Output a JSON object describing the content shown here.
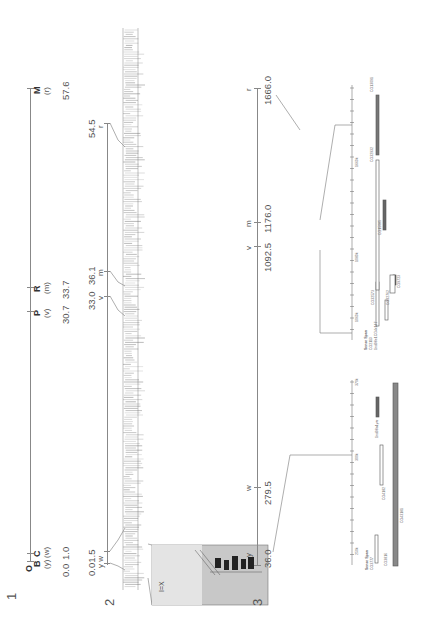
{
  "figure": {
    "panels": [
      {
        "id": "1",
        "label": "1",
        "type": "genetic-map-overview",
        "unit": "cM",
        "markers": [
          {
            "name": "B",
            "allele": "(y)",
            "position": "0.0"
          },
          {
            "name": "C",
            "allele": "(w)",
            "position": "1.0"
          },
          {
            "name": "P",
            "allele": "(v)",
            "position": "30.7"
          },
          {
            "name": "R",
            "allele": "(m)",
            "position": "33.7"
          },
          {
            "name": "M",
            "allele": "(r)",
            "position": "57.6"
          }
        ],
        "top_label_extra": "O"
      },
      {
        "id": "2",
        "label": "2",
        "type": "genetic-map-detailed",
        "markers": [
          {
            "allele": "y",
            "position": "0.0"
          },
          {
            "allele": "w",
            "position": "1.5"
          },
          {
            "allele": "v",
            "position": "33.0"
          },
          {
            "allele": "m",
            "position": "36.1"
          },
          {
            "allele": "r",
            "position": "54.5"
          }
        ],
        "combined_label": "0.01.5",
        "combined_alleles": "y w",
        "inset": {
          "caption": "I=X",
          "description": "polytene chromosome photo inset"
        }
      },
      {
        "id": "3",
        "label": "3",
        "type": "physical-map",
        "markers": [
          {
            "allele": "y",
            "position": "36.0"
          },
          {
            "allele": "w",
            "position": "279.5"
          },
          {
            "allele": "v",
            "position": "1092.5"
          },
          {
            "allele": "m",
            "position": "1176.0"
          },
          {
            "allele": "r",
            "position": "1666.0"
          }
        ],
        "ruler_ticks": [
          "250k",
          "300k",
          "370k",
          "1060k",
          "1080k",
          "1660k"
        ],
        "contig_headers": {
          "left": "Sense Span",
          "left2": "Sense Span"
        },
        "contigs": [
          {
            "id": "CG3777"
          },
          {
            "id": "CG3816"
          },
          {
            "id": "CG4182"
          },
          {
            "id": "CG43181"
          },
          {
            "id": "1nd98a1yar"
          },
          {
            "id": "CG2113"
          },
          {
            "id": "1nd98e1CG4x147"
          },
          {
            "id": "CG32573"
          },
          {
            "id": "CG32762"
          },
          {
            "id": "CG9723"
          },
          {
            "id": "CG15085"
          },
          {
            "id": "CG32932"
          },
          {
            "id": "CG13091"
          }
        ]
      }
    ]
  }
}
